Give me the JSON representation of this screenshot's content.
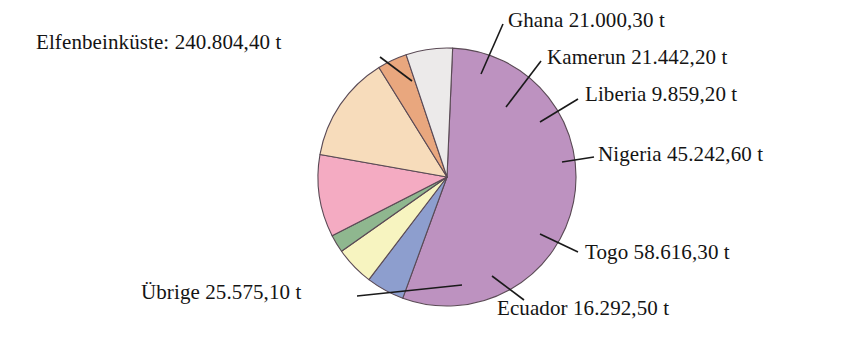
{
  "chart_data": {
    "type": "pie",
    "title": "",
    "subtitle": "",
    "unit": "t",
    "total": 438832.6,
    "legend_position": "callout-labels",
    "grid": false,
    "categories": [
      "Elfenbeinküste",
      "Ghana",
      "Kamerun",
      "Liberia",
      "Nigeria",
      "Togo",
      "Ecuador",
      "Übrige"
    ],
    "values": [
      240804.4,
      21000.3,
      21442.2,
      9859.2,
      45242.6,
      58616.3,
      16292.5,
      25575.1
    ],
    "value_labels": [
      "240.804,40 t",
      "21.000,30 t",
      "21.442,20 t",
      "9.859,20 t",
      "45.242,60 t",
      "58.616,30 t",
      "16.292,50 t",
      "25.575,10 t"
    ],
    "colors": [
      "#bd92c0",
      "#8d9ece",
      "#f7f4c0",
      "#8fb78f",
      "#f4abc2",
      "#f7dcbb",
      "#e9a77e",
      "#eceaea"
    ],
    "slices": [
      {
        "name": "Elfenbeinküste",
        "value": 240804.4,
        "label": "Elfenbeinküste: 240.804,40 t",
        "color": "#bd92c0",
        "percent": 54.87
      },
      {
        "name": "Ghana",
        "value": 21000.3,
        "label": "Ghana 21.000,30 t",
        "color": "#8d9ece",
        "percent": 4.79
      },
      {
        "name": "Kamerun",
        "value": 21442.2,
        "label": "Kamerun 21.442,20 t",
        "color": "#f7f4c0",
        "percent": 4.89
      },
      {
        "name": "Liberia",
        "value": 9859.2,
        "label": "Liberia 9.859,20 t",
        "color": "#8fb78f",
        "percent": 2.25
      },
      {
        "name": "Nigeria",
        "value": 45242.6,
        "label": "Nigeria 45.242,60 t",
        "color": "#f4abc2",
        "percent": 10.31
      },
      {
        "name": "Togo",
        "value": 58616.3,
        "label": "Togo 58.616,30 t",
        "color": "#f7dcbb",
        "percent": 13.36
      },
      {
        "name": "Ecuador",
        "value": 16292.5,
        "label": "Ecuador 16.292,50 t",
        "color": "#e9a77e",
        "percent": 3.71
      },
      {
        "name": "Übrige",
        "value": 25575.1,
        "label": "Übrige 25.575,10 t",
        "color": "#eceaea",
        "percent": 5.83
      }
    ]
  },
  "labels": {
    "elfenbeinkueste": "Elfenbeinküste: 240.804,40 t",
    "ghana": "Ghana 21.000,30 t",
    "kamerun": "Kamerun 21.442,20 t",
    "liberia": "Liberia 9.859,20 t",
    "nigeria": "Nigeria 45.242,60 t",
    "togo": "Togo 58.616,30 t",
    "ecuador": "Ecuador 16.292,50 t",
    "uebrige": "Übrige 25.575,10 t"
  },
  "style": {
    "background": "#ffffff",
    "text_color": "#141414",
    "slice_stroke": "#5a4a55"
  }
}
